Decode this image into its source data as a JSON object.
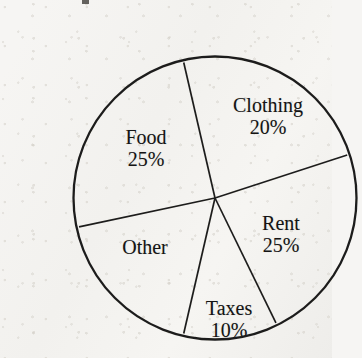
{
  "figure": {
    "background_color": "#f5f4f1",
    "ink_color": "#1a1a1a",
    "top_crop_mark_name": "cropped-glyph-mark"
  },
  "chart_data": {
    "type": "pie",
    "title": "",
    "subtitle": "",
    "xlabel": "",
    "ylabel": "",
    "legend": "none",
    "grid": false,
    "value_unit": "%",
    "total": 100,
    "center_x": 175,
    "center_y": 182,
    "radius": 142,
    "categories": [
      "Clothing",
      "Rent",
      "Taxes",
      "Other",
      "Food"
    ],
    "values": [
      20,
      25,
      10,
      20,
      25
    ],
    "labels_shown": [
      "Clothing 20%",
      "Rent 25%",
      "Taxes 10%",
      "Other",
      "Food 25%"
    ],
    "slices": [
      {
        "name": "Clothing",
        "value": 20,
        "value_label": "20%",
        "start_angle_deg": -103,
        "end_angle_deg": -18,
        "label_visible": true,
        "percent_visible": true
      },
      {
        "name": "Rent",
        "value": 25,
        "value_label": "25%",
        "start_angle_deg": -18,
        "end_angle_deg": 64,
        "label_visible": true,
        "percent_visible": true
      },
      {
        "name": "Taxes",
        "value": 10,
        "value_label": "10%",
        "start_angle_deg": 64,
        "end_angle_deg": 103,
        "label_visible": true,
        "percent_visible": true
      },
      {
        "name": "Other",
        "value": 20,
        "value_label": "",
        "start_angle_deg": 103,
        "end_angle_deg": 168,
        "label_visible": true,
        "percent_visible": false
      },
      {
        "name": "Food",
        "value": 25,
        "value_label": "25%",
        "start_angle_deg": 168,
        "end_angle_deg": 257,
        "label_visible": true,
        "percent_visible": true
      }
    ],
    "slice_fill": "none",
    "stroke_color": "#1f1e1c"
  }
}
